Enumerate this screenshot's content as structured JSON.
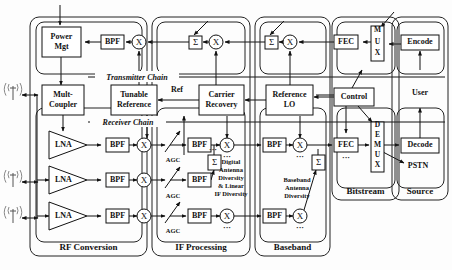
{
  "figure": {
    "type": "block-diagram",
    "width": 452,
    "height": 270,
    "background_color": "#fdfdfd",
    "line_color": "#111111"
  },
  "chain_labels": {
    "transmitter": "Transmitter Chain",
    "receiver": "Receiver Chain"
  },
  "groups": [
    {
      "id": "rf",
      "label": "RF Conversion",
      "x": 30,
      "y": 17,
      "w": 117,
      "h": 239
    },
    {
      "id": "if",
      "label": "IF Processing",
      "x": 152,
      "y": 17,
      "w": 98,
      "h": 239
    },
    {
      "id": "bb",
      "label": "Baseband",
      "x": 255,
      "y": 17,
      "w": 75,
      "h": 239
    },
    {
      "id": "bits",
      "label": "Bitstream",
      "x": 332,
      "y": 17,
      "w": 67,
      "h": 183
    },
    {
      "id": "src",
      "label": "Source",
      "x": 392,
      "y": 17,
      "w": 56,
      "h": 183
    }
  ],
  "subgroups": [
    {
      "id": "tx-rf",
      "x": 36,
      "y": 22,
      "w": 106,
      "h": 52
    },
    {
      "id": "rx-rf",
      "x": 36,
      "y": 108,
      "w": 106,
      "h": 134
    },
    {
      "id": "tx-if",
      "x": 157,
      "y": 22,
      "w": 88,
      "h": 52
    },
    {
      "id": "rx-if",
      "x": 157,
      "y": 108,
      "w": 88,
      "h": 134
    },
    {
      "id": "tx-bb",
      "x": 260,
      "y": 22,
      "w": 66,
      "h": 52
    },
    {
      "id": "rx-bb",
      "x": 260,
      "y": 108,
      "w": 66,
      "h": 134
    },
    {
      "id": "tx-bits",
      "x": 337,
      "y": 22,
      "w": 58,
      "h": 52
    },
    {
      "id": "rx-bits",
      "x": 337,
      "y": 108,
      "w": 58,
      "h": 80
    },
    {
      "id": "tx-src",
      "x": 397,
      "y": 22,
      "w": 47,
      "h": 52
    },
    {
      "id": "rx-src",
      "x": 397,
      "y": 108,
      "w": 47,
      "h": 80
    }
  ],
  "blocks": [
    {
      "id": "power-mgt",
      "name": "power-management-block",
      "label": "Power\nMgt",
      "x": 42,
      "y": 27,
      "w": 39,
      "h": 30,
      "shape": "rect"
    },
    {
      "id": "mult-coupler",
      "name": "multi-coupler-block",
      "label": "Mult-\nCoupler",
      "x": 42,
      "y": 85,
      "w": 42,
      "h": 30,
      "shape": "rect"
    },
    {
      "id": "tunable-ref",
      "name": "tunable-reference-block",
      "label": "Tunable\nReference",
      "x": 111,
      "y": 85,
      "w": 46,
      "h": 30,
      "shape": "rect"
    },
    {
      "id": "carrier-rec",
      "name": "carrier-recovery-block",
      "label": "Carrier\nRecovery",
      "x": 199,
      "y": 85,
      "w": 45,
      "h": 30,
      "shape": "rect"
    },
    {
      "id": "reference-lo",
      "name": "reference-lo-block",
      "label": "Reference\nLO",
      "x": 266,
      "y": 85,
      "w": 47,
      "h": 30,
      "shape": "rect"
    },
    {
      "id": "control",
      "name": "control-block",
      "label": "Control",
      "x": 334,
      "y": 88,
      "w": 40,
      "h": 18,
      "shape": "rect"
    },
    {
      "id": "bpf-tx-rf",
      "name": "bandpass-filter-tx-rf",
      "label": "BPF",
      "x": 101,
      "y": 35,
      "w": 23,
      "h": 14,
      "shape": "rect"
    },
    {
      "id": "fec-tx",
      "name": "fec-encoder-tx",
      "label": "FEC",
      "x": 334,
      "y": 35,
      "w": 24,
      "h": 14,
      "shape": "rect"
    },
    {
      "id": "mux",
      "name": "mux-block",
      "label": "M\nU\nX",
      "x": 371,
      "y": 26,
      "w": 13,
      "h": 35,
      "shape": "rect-stack"
    },
    {
      "id": "encode",
      "name": "encoder-block",
      "label": "Encode",
      "x": 401,
      "y": 35,
      "w": 38,
      "h": 15,
      "shape": "rect"
    },
    {
      "id": "bpf-rx-1",
      "name": "bandpass-filter-rx-1",
      "label": "BPF",
      "x": 106,
      "y": 138,
      "w": 23,
      "h": 14,
      "shape": "rect"
    },
    {
      "id": "bpf-rx-2",
      "name": "bandpass-filter-rx-2",
      "label": "BPF",
      "x": 106,
      "y": 173,
      "w": 23,
      "h": 14,
      "shape": "rect"
    },
    {
      "id": "bpf-rx-3",
      "name": "bandpass-filter-rx-3",
      "label": "BPF",
      "x": 106,
      "y": 209,
      "w": 23,
      "h": 14,
      "shape": "rect"
    },
    {
      "id": "bpf-if-1",
      "name": "bandpass-filter-if-1",
      "label": "BPF",
      "x": 188,
      "y": 138,
      "w": 23,
      "h": 14,
      "shape": "rect"
    },
    {
      "id": "bpf-if-2",
      "name": "bandpass-filter-if-2",
      "label": "BPF",
      "x": 188,
      "y": 173,
      "w": 23,
      "h": 14,
      "shape": "rect"
    },
    {
      "id": "bpf-if-3",
      "name": "bandpass-filter-if-3",
      "label": "BPF",
      "x": 188,
      "y": 209,
      "w": 23,
      "h": 14,
      "shape": "rect"
    },
    {
      "id": "bpf-bb-1",
      "name": "bandpass-filter-bb-1",
      "label": "BPF",
      "x": 263,
      "y": 138,
      "w": 23,
      "h": 14,
      "shape": "rect"
    },
    {
      "id": "bpf-bb-3",
      "name": "bandpass-filter-bb-3",
      "label": "BPF",
      "x": 263,
      "y": 209,
      "w": 23,
      "h": 14,
      "shape": "rect"
    },
    {
      "id": "fec-rx",
      "name": "fec-decoder-rx",
      "label": "FEC",
      "x": 334,
      "y": 138,
      "w": 24,
      "h": 14,
      "shape": "rect"
    },
    {
      "id": "demux",
      "name": "demux-block",
      "label": "D\nE\nM\nU\nX",
      "x": 371,
      "y": 122,
      "w": 13,
      "h": 50,
      "shape": "rect-stack"
    },
    {
      "id": "decode",
      "name": "decoder-block",
      "label": "Decode",
      "x": 401,
      "y": 138,
      "w": 38,
      "h": 15,
      "shape": "rect"
    },
    {
      "id": "lna-1",
      "name": "low-noise-amplifier-1",
      "label": "LNA",
      "x": 49,
      "y": 131,
      "w": 38,
      "h": 28,
      "shape": "triangle"
    },
    {
      "id": "lna-2",
      "name": "low-noise-amplifier-2",
      "label": "LNA",
      "x": 49,
      "y": 166,
      "w": 38,
      "h": 28,
      "shape": "triangle"
    },
    {
      "id": "lna-3",
      "name": "low-noise-amplifier-3",
      "label": "LNA",
      "x": 49,
      "y": 202,
      "w": 38,
      "h": 28,
      "shape": "triangle"
    }
  ],
  "mixers": [
    {
      "id": "mix-tx-rf",
      "name": "mixer-tx-rf",
      "symbol": "X",
      "cx": 139,
      "cy": 42,
      "r": 7
    },
    {
      "id": "mix-tx-if",
      "name": "mixer-tx-if",
      "symbol": "X",
      "cx": 216,
      "cy": 42,
      "r": 7
    },
    {
      "id": "mix-tx-bb",
      "name": "mixer-tx-bb",
      "symbol": "X",
      "cx": 290,
      "cy": 42,
      "r": 7
    },
    {
      "id": "mix-rx-1",
      "name": "mixer-rx-1",
      "symbol": "X",
      "cx": 144,
      "cy": 145,
      "r": 7
    },
    {
      "id": "mix-rx-2",
      "name": "mixer-rx-2",
      "symbol": "X",
      "cx": 144,
      "cy": 180,
      "r": 7
    },
    {
      "id": "mix-rx-3",
      "name": "mixer-rx-3",
      "symbol": "X",
      "cx": 144,
      "cy": 216,
      "r": 7
    },
    {
      "id": "mix-if-1",
      "name": "mixer-if-1",
      "symbol": "X",
      "cx": 227,
      "cy": 145,
      "r": 7
    },
    {
      "id": "mix-if-3",
      "name": "mixer-if-3",
      "symbol": "X",
      "cx": 227,
      "cy": 216,
      "r": 7
    },
    {
      "id": "mix-bb-1",
      "name": "mixer-bb-1",
      "symbol": "X",
      "cx": 300,
      "cy": 145,
      "r": 7
    },
    {
      "id": "mix-bb-3",
      "name": "mixer-bb-3",
      "symbol": "X",
      "cx": 300,
      "cy": 216,
      "r": 7
    }
  ],
  "summers": [
    {
      "id": "sum-tx-if",
      "name": "summer-tx-if",
      "symbol": "Σ",
      "x": 189,
      "y": 36,
      "w": 13,
      "h": 13
    },
    {
      "id": "sum-tx-bb",
      "name": "summer-tx-bb",
      "symbol": "Σ",
      "x": 265,
      "y": 36,
      "w": 13,
      "h": 13
    },
    {
      "id": "sum-if-rx",
      "name": "summer-if-rx",
      "symbol": "Σ",
      "x": 208,
      "y": 155,
      "w": 13,
      "h": 15
    },
    {
      "id": "sum-bb-rx",
      "name": "summer-bb-rx",
      "symbol": "Σ",
      "x": 312,
      "y": 155,
      "w": 13,
      "h": 15
    }
  ],
  "agc_labels": [
    {
      "id": "agc-1",
      "name": "agc-label-1",
      "text": "AGC",
      "x": 173,
      "y": 162
    },
    {
      "id": "agc-2",
      "name": "agc-label-2",
      "text": "AGC",
      "x": 173,
      "y": 198
    },
    {
      "id": "agc-3",
      "name": "agc-label-3",
      "text": "AGC",
      "x": 173,
      "y": 233
    }
  ],
  "free_labels": [
    {
      "id": "ref",
      "name": "ref-signal-label",
      "text": "Ref",
      "x": 177,
      "y": 92,
      "cls": "free-label"
    },
    {
      "id": "user",
      "name": "user-label",
      "text": "User",
      "x": 420,
      "y": 95,
      "cls": "free-label"
    },
    {
      "id": "pstn",
      "name": "pstn-label",
      "text": "PSTN",
      "x": 418,
      "y": 168,
      "cls": "free-label"
    }
  ],
  "notes": [
    {
      "id": "digital-diversity",
      "name": "digital-antenna-diversity-note",
      "lines": [
        "Digital",
        "Antenna",
        "Diversity",
        "& Linear",
        "IF Diversity"
      ],
      "x": 231,
      "y": 164
    },
    {
      "id": "baseband-diversity",
      "name": "baseband-antenna-diversity-note",
      "lines": [
        "Baseband",
        "Antenna",
        "Diversity"
      ],
      "x": 297,
      "y": 182
    }
  ],
  "ellipses": [
    {
      "id": "dots-if-1",
      "name": "continuation-dots-if-1",
      "text": "···",
      "x": 227,
      "y": 159
    },
    {
      "id": "dots-if-3",
      "name": "continuation-dots-if-3",
      "text": "···",
      "x": 227,
      "y": 230
    },
    {
      "id": "dots-bb-1",
      "name": "continuation-dots-bb-1",
      "text": "···",
      "x": 300,
      "y": 159
    },
    {
      "id": "dots-bb-3",
      "name": "continuation-dots-bb-3",
      "text": "···",
      "x": 300,
      "y": 230
    },
    {
      "id": "dots-fec",
      "name": "continuation-dots-fec",
      "text": "···",
      "x": 346,
      "y": 160
    },
    {
      "id": "dots-if-2",
      "name": "continuation-dots-if-2",
      "text": "···",
      "x": 213,
      "y": 152
    }
  ],
  "antennas": [
    {
      "id": "ant-1",
      "name": "antenna-1",
      "x": 13,
      "y": 86
    },
    {
      "id": "ant-2",
      "name": "antenna-2",
      "x": 13,
      "y": 173
    },
    {
      "id": "ant-3",
      "name": "antenna-3",
      "x": 13,
      "y": 209
    }
  ],
  "wires": [
    {
      "name": "wire-tx-input-top",
      "d": "M 60,5 L 60,25",
      "arrow": "end"
    },
    {
      "name": "wire-bpf-to-powermgt",
      "d": "M 101,42 L 85,42",
      "arrow": "end"
    },
    {
      "name": "wire-mixer-to-bpf-tx",
      "d": "M 132,42 L 126,42",
      "arrow": "end"
    },
    {
      "name": "wire-powermgt-to-coupler",
      "d": "M 61,57 L 61,85",
      "arrow": "end"
    },
    {
      "name": "wire-tunref-to-mixtxrf",
      "d": "M 139,85 L 139,51",
      "arrow": "end"
    },
    {
      "name": "wire-sumtxif-to-mixtxrf",
      "d": "M 189,42 L 148,42",
      "arrow": "end"
    },
    {
      "name": "wire-mixtxif-to-sumtxif",
      "d": "M 209,42 L 203,42",
      "arrow": "end"
    },
    {
      "name": "wire-diag-in-txif",
      "d": "M 208,21 L 194,35",
      "arrow": "end"
    },
    {
      "name": "wire-carrier-to-mixtxif",
      "d": "M 216,85 L 216,51",
      "arrow": "end"
    },
    {
      "name": "wire-sumtxbb-to-mixtxif",
      "d": "M 265,42 L 225,42",
      "arrow": "end"
    },
    {
      "name": "wire-mixtxbb-to-sumtxbb",
      "d": "M 283,42 L 279,42",
      "arrow": "end"
    },
    {
      "name": "wire-diag-in-txbb",
      "d": "M 284,21 L 270,35",
      "arrow": "end"
    },
    {
      "name": "wire-reflo-to-mixtxbb",
      "d": "M 290,85 L 290,51",
      "arrow": "end"
    },
    {
      "name": "wire-fectx-to-mixtxbb",
      "d": "M 334,42 L 299,42",
      "arrow": "end"
    },
    {
      "name": "wire-mux-to-fectx",
      "d": "M 371,42 L 363,42",
      "arrow": "end"
    },
    {
      "name": "wire-encode-to-mux",
      "d": "M 401,44 L 389,44",
      "arrow": "end"
    },
    {
      "name": "wire-diag-in-mux",
      "d": "M 394,12 L 381,27",
      "arrow": "end"
    },
    {
      "name": "wire-user-to-encode",
      "d": "M 420,70 L 420,51",
      "arrow": "end"
    },
    {
      "name": "wire-carrier-to-tunref",
      "d": "M 199,100 L 158,100",
      "arrow": "end"
    },
    {
      "name": "wire-reflo-to-carrier",
      "d": "M 266,100 L 245,100",
      "arrow": "end"
    },
    {
      "name": "wire-control-to-reflo",
      "d": "M 334,97 L 314,97",
      "arrow": "end"
    },
    {
      "name": "wire-control-to-fectx",
      "d": "M 352,88 L 362,70",
      "arrow": "end"
    },
    {
      "name": "wire-control-to-fecrx",
      "d": "M 346,106 L 346,133",
      "arrow": "end"
    },
    {
      "name": "wire-control-to-demux",
      "d": "M 358,106 L 372,122",
      "arrow": "end"
    },
    {
      "name": "wire-control-left-out",
      "d": "M 334,95 L 316,95",
      "arrow": "none"
    },
    {
      "name": "wire-coupler-to-lna1",
      "d": "M 63,115 L 63,131",
      "arrow": "end"
    },
    {
      "name": "wire-lna1-to-bpf1",
      "d": "M 87,145 L 101,145",
      "arrow": "end"
    },
    {
      "name": "wire-lna2-to-bpf2",
      "d": "M 87,180 L 101,180",
      "arrow": "end"
    },
    {
      "name": "wire-lna3-to-bpf3",
      "d": "M 87,216 L 101,216",
      "arrow": "end"
    },
    {
      "name": "wire-bpf1-to-mix1",
      "d": "M 129,145 L 137,145",
      "arrow": "end"
    },
    {
      "name": "wire-bpf2-to-mix2",
      "d": "M 129,180 L 137,180",
      "arrow": "end"
    },
    {
      "name": "wire-bpf3-to-mix3",
      "d": "M 129,216 L 137,216",
      "arrow": "end"
    },
    {
      "name": "wire-tunref-to-mixrx1",
      "d": "M 147,115 L 147,138",
      "arrow": "end"
    },
    {
      "name": "wire-mix1-to-agc1",
      "d": "M 151,145 L 165,145",
      "arrow": "end"
    },
    {
      "name": "wire-mix2-to-agc2",
      "d": "M 151,180 L 165,180",
      "arrow": "end"
    },
    {
      "name": "wire-mix3-to-agc3",
      "d": "M 151,216 L 165,216",
      "arrow": "end"
    },
    {
      "name": "wire-agc1-to-bpfif1",
      "d": "M 170,145 L 186,145",
      "arrow": "end"
    },
    {
      "name": "wire-agc2-to-bpfif2",
      "d": "M 170,180 L 186,180",
      "arrow": "end"
    },
    {
      "name": "wire-agc3-to-bpfif3",
      "d": "M 170,216 L 186,216",
      "arrow": "end"
    },
    {
      "name": "wire-agc-slash-1",
      "d": "M 165,152 L 180,131",
      "arrow": "end"
    },
    {
      "name": "wire-agc-slash-2",
      "d": "M 165,188 L 180,167",
      "arrow": "end"
    },
    {
      "name": "wire-agc-slash-3",
      "d": "M 165,223 L 180,202",
      "arrow": "end"
    },
    {
      "name": "wire-bpfif1-to-mixif1",
      "d": "M 211,145 L 220,145",
      "arrow": "end"
    },
    {
      "name": "wire-bpfif3-to-mixif3",
      "d": "M 211,216 L 220,216",
      "arrow": "end"
    },
    {
      "name": "wire-bpfif1-to-sumif",
      "d": "M 214,145 L 214,155",
      "arrow": "none"
    },
    {
      "name": "wire-bpfif2-to-sumif",
      "d": "M 211,180 L 214,170",
      "arrow": "end"
    },
    {
      "name": "wire-sumif-to-carrier",
      "d": "M 184,155 L 184,116",
      "arrow": "end"
    },
    {
      "name": "wire-carrier-to-mixif1",
      "d": "M 227,116 L 227,138",
      "arrow": "end"
    },
    {
      "name": "wire-mixif1-to-bpfbb1",
      "d": "M 234,145 L 261,145",
      "arrow": "end"
    },
    {
      "name": "wire-mixif3-to-bpfbb3",
      "d": "M 234,216 L 261,216",
      "arrow": "end"
    },
    {
      "name": "wire-bpfbb1-to-mixbb1",
      "d": "M 286,145 L 293,145",
      "arrow": "end"
    },
    {
      "name": "wire-bpfbb3-to-mixbb3",
      "d": "M 286,216 L 293,216",
      "arrow": "end"
    },
    {
      "name": "wire-reflo-to-mixbb1",
      "d": "M 300,116 L 300,138",
      "arrow": "end"
    },
    {
      "name": "wire-mixbb1-to-fecrx",
      "d": "M 307,145 L 332,145",
      "arrow": "end"
    },
    {
      "name": "wire-sumbb-to-chain",
      "d": "M 318,155 L 318,149",
      "arrow": "none"
    },
    {
      "name": "wire-mixbb3-to-sumbb",
      "d": "M 304,210 L 316,170",
      "arrow": "end"
    },
    {
      "name": "wire-fecrx-to-demux",
      "d": "M 358,145 L 369,145",
      "arrow": "end"
    },
    {
      "name": "wire-demux-to-decode",
      "d": "M 384,145 L 399,145",
      "arrow": "end"
    },
    {
      "name": "wire-demux-to-pstn",
      "d": "M 383,152 L 404,163",
      "arrow": "end"
    },
    {
      "name": "wire-decode-to-user",
      "d": "M 420,138 L 420,108",
      "arrow": "end"
    },
    {
      "name": "wire-ant1-link",
      "d": "M 22,95 L 38,95",
      "arrow": "both"
    },
    {
      "name": "wire-ant2-link",
      "d": "M 22,182 L 38,182",
      "arrow": "both"
    },
    {
      "name": "wire-ant3-link",
      "d": "M 22,218 L 38,218",
      "arrow": "both"
    },
    {
      "name": "wire-ant-bus",
      "d": "M 37,95 L 37,218",
      "arrow": "none"
    },
    {
      "name": "wire-ant-bus-to-lna2",
      "d": "M 37,180 L 49,180",
      "arrow": "end"
    },
    {
      "name": "wire-ant-bus-to-lna3",
      "d": "M 37,216 L 49,216",
      "arrow": "end"
    },
    {
      "name": "wire-chain-tx-h",
      "d": "M 88,77 L 445,77",
      "arrow": "none"
    },
    {
      "name": "wire-chain-rx-h",
      "d": "M 88,122 L 445,122",
      "arrow": "none"
    }
  ]
}
